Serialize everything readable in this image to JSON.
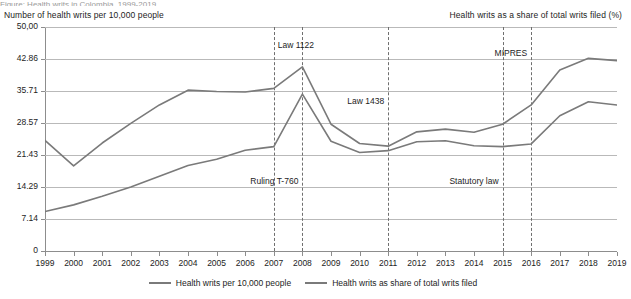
{
  "figure": {
    "title_partial": "Figure: Health writs in Colombia, 1999-2019",
    "left_axis_title": "Number of health writs per 10,000 people",
    "right_axis_title": "Health writs as a share of total writs filed (%)"
  },
  "legend": [
    {
      "label": "Health writs per 10,000 people",
      "color": "#7a7a7a"
    },
    {
      "label": "Health writs as share of total writs filed",
      "color": "#7a7a7a"
    }
  ],
  "annotations": [
    {
      "label": "Law 1122",
      "year": 2007
    },
    {
      "label": "Ruling T-760",
      "year": 2008
    },
    {
      "label": "Law 1438",
      "year": 2011
    },
    {
      "label": "Statutory law",
      "year": 2015
    },
    {
      "label": "MIPRES",
      "year": 2016
    }
  ],
  "chart_data": {
    "type": "line",
    "title": "Health writs in Colombia, 1999-2019",
    "xlabel": "",
    "ylabel": "Number of health writs per 10,000 people",
    "y2label": "Health writs as a share of total writs filed (%)",
    "grid": true,
    "legend_position": "bottom",
    "ylim": [
      0,
      50
    ],
    "yticks": [
      "0",
      "7.14",
      "14.29",
      "21.43",
      "28.57",
      "35.71",
      "42.86",
      "50,00"
    ],
    "ytick_values": [
      0,
      7.14,
      14.29,
      21.43,
      28.57,
      35.71,
      42.86,
      50.0
    ],
    "categories": [
      1999,
      2000,
      2001,
      2002,
      2003,
      2004,
      2005,
      2006,
      2007,
      2008,
      2009,
      2010,
      2011,
      2012,
      2013,
      2014,
      2015,
      2016,
      2017,
      2018,
      2019
    ],
    "xticks": [
      "1999",
      "2000",
      "2001",
      "2002",
      "2003",
      "2004",
      "2005",
      "2006",
      "2007",
      "2008",
      "2009",
      "2010",
      "2011",
      "2012",
      "2013",
      "2014",
      "2015",
      "2016",
      "2017",
      "2018",
      "2019"
    ],
    "series": [
      {
        "name": "Health writs per 10,000 people",
        "color": "#7a7a7a",
        "values": [
          8.8,
          10.3,
          12.2,
          14.3,
          16.7,
          19.1,
          20.5,
          22.5,
          23.3,
          35.0,
          24.5,
          22.0,
          22.4,
          24.4,
          24.6,
          23.5,
          23.3,
          23.9,
          30.2,
          33.3,
          32.6
        ]
      },
      {
        "name": "Health writs as share of total writs filed",
        "color": "#7a7a7a",
        "values": [
          24.7,
          19.0,
          24.1,
          28.5,
          32.6,
          35.9,
          35.6,
          35.5,
          36.3,
          41.1,
          28.3,
          24.0,
          23.4,
          26.6,
          27.2,
          26.5,
          28.3,
          32.6,
          40.4,
          43.0,
          42.5
        ]
      }
    ]
  }
}
